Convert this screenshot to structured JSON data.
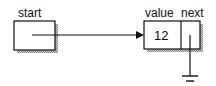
{
  "diagram": {
    "pointer": {
      "label": "start"
    },
    "node": {
      "value_label": "value",
      "next_label": "next",
      "value": "12",
      "next": "null (ground symbol)"
    }
  }
}
